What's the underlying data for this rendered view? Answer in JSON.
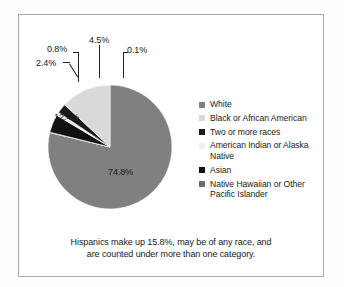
{
  "figure": {
    "caption_line1": "Hispanics make up 15.8%, may be of any race, and",
    "caption_line2": "are counted under more than one category."
  },
  "legend": {
    "items": [
      {
        "label": "White",
        "color": "#808080"
      },
      {
        "label": "Black or African American",
        "color": "#d9d9d9"
      },
      {
        "label": "Two or more races",
        "color": "#1a1a1a"
      },
      {
        "label": "American Indian or Alaska Native",
        "color": "#efefef"
      },
      {
        "label": "Asian",
        "color": "#111111"
      },
      {
        "label": "Native Hawaiian or Other Pacific Islander",
        "color": "#6e6e6e"
      }
    ]
  },
  "slice_labels": {
    "white": "74.8%",
    "black": "12.4%",
    "two_or_more": "2.4%",
    "american_indian": "0.8%",
    "asian": "4.5%",
    "native_hawaiian": "0.1%"
  },
  "chart_data": {
    "type": "pie",
    "title": "",
    "subtitle": "",
    "categories": [
      "White",
      "Black or African American",
      "Two or more races",
      "American Indian or Alaska Native",
      "Asian",
      "Native Hawaiian or Other Pacific Islander"
    ],
    "values": [
      74.8,
      12.4,
      2.4,
      0.8,
      4.5,
      0.1
    ],
    "value_labels": [
      "74.8%",
      "12.4%",
      "2.4%",
      "0.8%",
      "4.5%",
      "0.1%"
    ],
    "colors": [
      "#808080",
      "#d9d9d9",
      "#1a1a1a",
      "#efefef",
      "#111111",
      "#6e6e6e"
    ],
    "units": "percent",
    "legend": "right",
    "grid": false,
    "annotations": [
      "Hispanics make up 15.8%, may be of any race, and are counted under more than one category."
    ]
  }
}
